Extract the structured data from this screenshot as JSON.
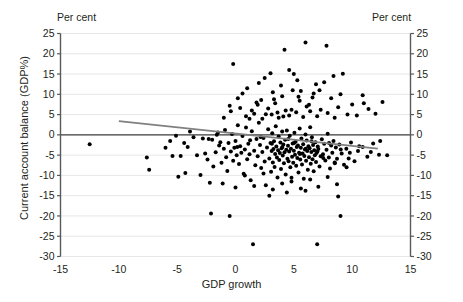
{
  "chart_data": {
    "type": "scatter",
    "title": "",
    "xlabel": "GDP growth",
    "ylabel": "Current account balance (GDP%)",
    "unit_label_left": "Per cent",
    "unit_label_right": "Per cent",
    "xlim": [
      -15,
      15
    ],
    "ylim": [
      -30,
      25
    ],
    "xticks": [
      -15,
      -10,
      -5,
      0,
      5,
      10,
      15
    ],
    "yticks": [
      -30,
      -25,
      -20,
      -15,
      -10,
      -5,
      0,
      5,
      10,
      15,
      20,
      25
    ],
    "grid": true,
    "grid_color": "#e8e6e6",
    "point_color": "#000000",
    "trendline_color": "#808080",
    "zeroline_color": "#3a3a3a",
    "axis_color": "#58595b",
    "legend": [],
    "trendline": {
      "name": "linear fit",
      "x": [
        -10.0,
        12.2
      ],
      "y": [
        3.4,
        -3.4
      ]
    },
    "series": [
      {
        "name": "Countries",
        "points": [
          [
            -12.5,
            -2.3
          ],
          [
            -7.6,
            -5.6
          ],
          [
            -7.4,
            -8.6
          ],
          [
            -5.4,
            -5.2
          ],
          [
            -4.7,
            -5.2
          ],
          [
            -4.9,
            -10.3
          ],
          [
            -4.3,
            -9.4
          ],
          [
            -4.1,
            -3.0
          ],
          [
            -3.6,
            -0.6
          ],
          [
            -3.3,
            -5.0
          ],
          [
            -3.0,
            -9.9
          ],
          [
            -2.6,
            -4.6
          ],
          [
            -2.4,
            -6.1
          ],
          [
            -2.2,
            -11.8
          ],
          [
            -2.1,
            -19.4
          ],
          [
            -2.0,
            -1.2
          ],
          [
            -1.9,
            -7.8
          ],
          [
            -1.7,
            -4.3
          ],
          [
            -1.5,
            0.6
          ],
          [
            -1.4,
            -2.6
          ],
          [
            -1.2,
            -6.9
          ],
          [
            -1.1,
            -12.0
          ],
          [
            -1.0,
            -3.4
          ],
          [
            -0.9,
            1.2
          ],
          [
            -0.8,
            -5.5
          ],
          [
            -0.7,
            -8.9
          ],
          [
            -0.6,
            -2.0
          ],
          [
            -0.5,
            -20.0
          ],
          [
            -0.4,
            -4.1
          ],
          [
            -0.3,
            0.2
          ],
          [
            -0.2,
            -6.4
          ],
          [
            -0.1,
            -3.2
          ],
          [
            0.0,
            -1.5
          ],
          [
            0.1,
            -5.0
          ],
          [
            0.2,
            2.4
          ],
          [
            0.3,
            -7.2
          ],
          [
            0.4,
            -2.8
          ],
          [
            0.5,
            -4.4
          ],
          [
            0.6,
            -0.3
          ],
          [
            0.7,
            -9.6
          ],
          [
            0.8,
            -3.6
          ],
          [
            0.9,
            1.8
          ],
          [
            1.0,
            -6.0
          ],
          [
            1.1,
            -2.2
          ],
          [
            1.2,
            -4.8
          ],
          [
            1.3,
            -11.2
          ],
          [
            1.4,
            0.9
          ],
          [
            1.5,
            -27.0
          ],
          [
            1.6,
            -3.9
          ],
          [
            1.7,
            -7.5
          ],
          [
            1.8,
            -1.0
          ],
          [
            1.9,
            -5.3
          ],
          [
            2.0,
            3.0
          ],
          [
            2.1,
            -2.5
          ],
          [
            2.2,
            -8.2
          ],
          [
            2.3,
            -4.2
          ],
          [
            2.4,
            -0.8
          ],
          [
            2.5,
            -6.6
          ],
          [
            2.6,
            -12.4
          ],
          [
            2.7,
            -3.1
          ],
          [
            2.8,
            1.4
          ],
          [
            2.9,
            -5.8
          ],
          [
            3.0,
            -2.0
          ],
          [
            3.05,
            -9.1
          ],
          [
            3.1,
            -4.0
          ],
          [
            3.15,
            0.4
          ],
          [
            3.2,
            -6.8
          ],
          [
            3.25,
            -3.5
          ],
          [
            3.3,
            -1.6
          ],
          [
            3.35,
            -7.9
          ],
          [
            3.4,
            -4.7
          ],
          [
            3.45,
            2.1
          ],
          [
            3.5,
            -2.9
          ],
          [
            3.55,
            -5.6
          ],
          [
            3.6,
            -10.5
          ],
          [
            3.65,
            -3.8
          ],
          [
            3.7,
            -0.4
          ],
          [
            3.75,
            -6.2
          ],
          [
            3.8,
            -4.5
          ],
          [
            3.85,
            -1.9
          ],
          [
            3.9,
            -8.4
          ],
          [
            3.95,
            -3.3
          ],
          [
            4.0,
            0.8
          ],
          [
            4.05,
            -5.1
          ],
          [
            4.1,
            -2.4
          ],
          [
            4.15,
            -7.0
          ],
          [
            4.2,
            -4.3
          ],
          [
            4.25,
            -1.2
          ],
          [
            4.3,
            -9.8
          ],
          [
            4.35,
            -3.7
          ],
          [
            4.4,
            1.1
          ],
          [
            4.45,
            -5.9
          ],
          [
            4.5,
            -2.7
          ],
          [
            4.55,
            -6.5
          ],
          [
            4.6,
            -4.1
          ],
          [
            4.65,
            -0.2
          ],
          [
            4.7,
            -8.0
          ],
          [
            4.75,
            -3.4
          ],
          [
            4.8,
            -11.5
          ],
          [
            4.85,
            -5.4
          ],
          [
            4.9,
            -2.1
          ],
          [
            4.95,
            -6.9
          ],
          [
            5.0,
            -3.9
          ],
          [
            5.05,
            0.5
          ],
          [
            5.1,
            -4.9
          ],
          [
            5.15,
            -1.7
          ],
          [
            5.2,
            -7.6
          ],
          [
            5.25,
            -3.0
          ],
          [
            5.3,
            -5.7
          ],
          [
            5.35,
            -2.6
          ],
          [
            5.4,
            -9.3
          ],
          [
            5.45,
            -4.4
          ],
          [
            5.5,
            1.6
          ],
          [
            5.55,
            -6.1
          ],
          [
            5.6,
            -3.2
          ],
          [
            5.65,
            -0.9
          ],
          [
            5.7,
            -7.3
          ],
          [
            5.75,
            -4.6
          ],
          [
            5.8,
            -2.3
          ],
          [
            5.85,
            -10.8
          ],
          [
            5.9,
            -5.2
          ],
          [
            5.95,
            -3.6
          ],
          [
            6.0,
            0.1
          ],
          [
            6.05,
            -6.4
          ],
          [
            6.1,
            -1.4
          ],
          [
            6.15,
            -4.0
          ],
          [
            6.2,
            -8.6
          ],
          [
            6.25,
            -2.8
          ],
          [
            6.3,
            -5.5
          ],
          [
            6.35,
            -3.3
          ],
          [
            6.4,
            1.9
          ],
          [
            6.45,
            -7.1
          ],
          [
            6.5,
            -4.2
          ],
          [
            6.55,
            -0.6
          ],
          [
            6.6,
            -6.0
          ],
          [
            6.65,
            -2.5
          ],
          [
            6.7,
            -9.0
          ],
          [
            6.75,
            -3.8
          ],
          [
            6.8,
            -5.0
          ],
          [
            6.85,
            -1.8
          ],
          [
            6.9,
            -6.7
          ],
          [
            6.95,
            -4.5
          ],
          [
            7.0,
            -27.0
          ],
          [
            7.05,
            -2.9
          ],
          [
            7.1,
            -3.5
          ],
          [
            7.2,
            -7.8
          ],
          [
            7.3,
            -5.3
          ],
          [
            7.4,
            -1.1
          ],
          [
            7.5,
            -4.8
          ],
          [
            7.6,
            -2.2
          ],
          [
            7.7,
            -6.3
          ],
          [
            7.8,
            -3.7
          ],
          [
            7.9,
            0.3
          ],
          [
            8.0,
            -5.6
          ],
          [
            8.1,
            -8.3
          ],
          [
            8.2,
            -2.6
          ],
          [
            8.3,
            -4.4
          ],
          [
            8.4,
            -1.5
          ],
          [
            8.5,
            -6.8
          ],
          [
            8.6,
            -3.1
          ],
          [
            8.7,
            -5.9
          ],
          [
            8.8,
            -15.2
          ],
          [
            8.9,
            -2.4
          ],
          [
            9.0,
            -20.0
          ],
          [
            9.1,
            -4.6
          ],
          [
            9.3,
            -7.4
          ],
          [
            9.5,
            -3.4
          ],
          [
            9.7,
            -5.8
          ],
          [
            9.9,
            -1.9
          ],
          [
            10.2,
            -6.5
          ],
          [
            10.5,
            -4.0
          ],
          [
            10.9,
            -3.0
          ],
          [
            11.3,
            -5.4
          ],
          [
            11.8,
            -2.1
          ],
          [
            12.3,
            -4.9
          ],
          [
            -5.1,
            -0.2
          ],
          [
            -3.9,
            0.8
          ],
          [
            -2.8,
            -0.9
          ],
          [
            -1.3,
            -1.8
          ],
          [
            0.15,
            -3.0
          ],
          [
            1.25,
            -1.3
          ],
          [
            2.15,
            -0.5
          ],
          [
            3.12,
            -2.2
          ],
          [
            4.02,
            -3.0
          ],
          [
            4.52,
            -1.0
          ],
          [
            5.02,
            -2.0
          ],
          [
            5.52,
            -4.7
          ],
          [
            6.02,
            -3.4
          ],
          [
            6.52,
            -1.6
          ],
          [
            7.02,
            -4.1
          ],
          [
            7.52,
            -5.7
          ],
          [
            8.02,
            -2.0
          ],
          [
            8.52,
            -7.0
          ],
          [
            9.02,
            -3.6
          ],
          [
            9.52,
            -8.0
          ],
          [
            0.9,
            4.6
          ],
          [
            1.6,
            5.2
          ],
          [
            2.3,
            4.0
          ],
          [
            2.8,
            6.5
          ],
          [
            3.1,
            5.0
          ],
          [
            3.4,
            7.8
          ],
          [
            3.7,
            4.2
          ],
          [
            4.0,
            9.5
          ],
          [
            4.3,
            6.0
          ],
          [
            4.6,
            4.8
          ],
          [
            4.9,
            11.0
          ],
          [
            5.2,
            5.6
          ],
          [
            5.5,
            8.4
          ],
          [
            5.8,
            4.4
          ],
          [
            6.1,
            7.0
          ],
          [
            6.4,
            5.8
          ],
          [
            6.7,
            10.2
          ],
          [
            7.0,
            4.6
          ],
          [
            7.3,
            6.2
          ],
          [
            7.6,
            13.0
          ],
          [
            7.9,
            5.4
          ],
          [
            8.2,
            9.0
          ],
          [
            8.5,
            4.2
          ],
          [
            8.8,
            6.8
          ],
          [
            9.2,
            15.1
          ],
          [
            9.6,
            5.0
          ],
          [
            10.0,
            7.5
          ],
          [
            10.4,
            4.8
          ],
          [
            10.9,
            9.8
          ],
          [
            11.4,
            6.4
          ],
          [
            12.0,
            5.2
          ],
          [
            12.6,
            8.1
          ],
          [
            -0.5,
            7.2
          ],
          [
            0.2,
            9.0
          ],
          [
            1.0,
            11.5
          ],
          [
            1.8,
            8.0
          ],
          [
            2.5,
            14.0
          ],
          [
            3.2,
            10.5
          ],
          [
            3.9,
            12.2
          ],
          [
            4.6,
            16.0
          ],
          [
            5.3,
            13.5
          ],
          [
            6.0,
            22.8
          ],
          [
            6.6,
            9.2
          ],
          [
            7.2,
            11.0
          ],
          [
            7.8,
            22.0
          ],
          [
            8.4,
            14.5
          ],
          [
            4.2,
            21.0
          ],
          [
            9.0,
            10.0
          ],
          [
            -0.2,
            17.5
          ],
          [
            2.0,
            12.8
          ],
          [
            0.6,
            10.2
          ],
          [
            1.4,
            6.0
          ],
          [
            2.2,
            8.6
          ],
          [
            3.0,
            15.2
          ],
          [
            3.6,
            5.5
          ],
          [
            5.0,
            15.0
          ],
          [
            5.6,
            10.8
          ],
          [
            6.3,
            7.4
          ],
          [
            6.9,
            12.5
          ],
          [
            11.0,
            7.8
          ],
          [
            -1.0,
            4.2
          ],
          [
            -0.4,
            5.8
          ],
          [
            0.4,
            6.6
          ],
          [
            1.2,
            4.0
          ],
          [
            1.9,
            7.4
          ],
          [
            2.6,
            5.1
          ],
          [
            3.3,
            8.8
          ],
          [
            4.1,
            4.5
          ],
          [
            4.8,
            6.2
          ],
          [
            5.4,
            9.4
          ],
          [
            0.0,
            -13.0
          ],
          [
            0.8,
            -10.0
          ],
          [
            1.6,
            -12.6
          ],
          [
            2.4,
            -9.5
          ],
          [
            3.2,
            -13.5
          ],
          [
            4.0,
            -12.0
          ],
          [
            4.8,
            -10.6
          ],
          [
            5.6,
            -13.2
          ],
          [
            6.4,
            -11.0
          ],
          [
            7.1,
            -12.8
          ],
          [
            7.9,
            -10.4
          ],
          [
            8.7,
            -12.2
          ],
          [
            2.9,
            -15.0
          ],
          [
            4.4,
            -14.2
          ],
          [
            6.0,
            -13.8
          ],
          [
            -6.0,
            -3.2
          ],
          [
            -5.6,
            -1.5
          ],
          [
            -4.4,
            -2.0
          ],
          [
            -2.3,
            -1.0
          ],
          [
            -1.6,
            0.0
          ],
          [
            13.0,
            -5.0
          ],
          [
            12.4,
            -1.5
          ],
          [
            11.6,
            -4.2
          ],
          [
            10.6,
            -2.8
          ],
          [
            9.8,
            -4.4
          ]
        ]
      }
    ]
  }
}
